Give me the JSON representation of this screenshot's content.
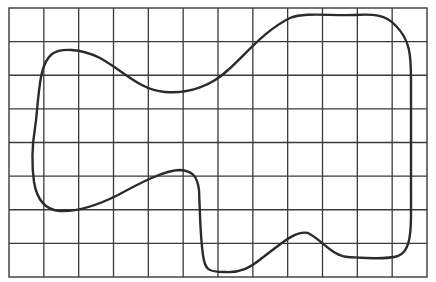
{
  "figure": {
    "type": "grid-with-closed-curve",
    "grid": {
      "columns": 12,
      "rows": 8,
      "left": 9,
      "top": 8,
      "right": 427,
      "bottom": 277,
      "line_color": "#3a3a3a"
    },
    "shape": {
      "description": "irregular closed blob outline drawn over grid",
      "stroke_color": "#2b2b2b",
      "path": "M 38 100 C 40 80, 42 62, 52 54 C 60 48, 80 48, 100 58 C 125 72, 140 90, 165 92 C 190 94, 212 85, 228 70 C 245 55, 265 30, 290 18 C 305 12, 330 16, 355 15 C 372 14, 386 14, 396 26 C 410 40, 411 55, 411 80 L 411 215 C 411 240, 408 252, 398 256 C 385 260, 365 258, 348 257 C 332 256, 322 240, 308 233 C 295 230, 280 245, 262 258 C 250 268, 240 273, 225 272 C 208 272, 205 270, 203 255 C 200 235, 200 210, 199 190 C 197 175, 192 171, 180 170 C 165 170, 140 183, 118 195 C 100 204, 80 212, 60 211 C 45 210, 37 200, 34 182 C 31 160, 33 140, 35 128 C 37 115, 37 108, 38 100 Z"
    }
  }
}
